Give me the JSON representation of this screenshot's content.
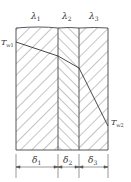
{
  "diagram": {
    "layers": [
      {
        "conductivity_symbol": "λ",
        "conductivity_index": "1",
        "thickness_symbol": "δ",
        "thickness_index": "1",
        "hatch": "forward"
      },
      {
        "conductivity_symbol": "λ",
        "conductivity_index": "2",
        "thickness_symbol": "δ",
        "thickness_index": "2",
        "hatch": "backward"
      },
      {
        "conductivity_symbol": "λ",
        "conductivity_index": "3",
        "thickness_symbol": "δ",
        "thickness_index": "3",
        "hatch": "backward"
      }
    ],
    "temperatures": {
      "inner": {
        "symbol": "T",
        "index": "w1"
      },
      "outer": {
        "symbol": "T",
        "index": "w2"
      }
    },
    "colors": {
      "line": "#444444",
      "hatch": "#555555",
      "text": "#333333"
    }
  }
}
